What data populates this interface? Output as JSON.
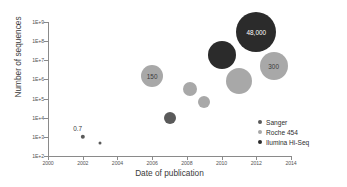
{
  "chart_data": {
    "type": "scatter",
    "title": "",
    "xlabel": "Date of publication",
    "ylabel": "Number of sequences",
    "xlim": [
      2000,
      2014
    ],
    "ylim": [
      100,
      1000000000
    ],
    "yscale": "log",
    "grid": false,
    "legend_position": "bottom-right",
    "xticks": [
      "2000",
      "2002",
      "2004",
      "2006",
      "2008",
      "2010",
      "2012",
      "2014"
    ],
    "yticks": [
      "1E+9",
      "1E+8",
      "1E+7",
      "1E+6",
      "1E+5",
      "1E+4",
      "1E+3",
      "1E+2"
    ],
    "series": [
      {
        "name": "Sanger",
        "color": "#5a5a5a",
        "points": [
          {
            "x": 2002,
            "y": 1000,
            "size": 4.4,
            "label": "",
            "ext_label": "0.7"
          },
          {
            "x": 2003,
            "y": 500,
            "size": 3.0,
            "label": ""
          },
          {
            "x": 2007,
            "y": 10000,
            "size": 12.0,
            "label": ""
          }
        ]
      },
      {
        "name": "Roche 454",
        "color": "#a8a8a8",
        "points": [
          {
            "x": 2006,
            "y": 1500000,
            "size": 22.0,
            "label": "150"
          },
          {
            "x": 2008.2,
            "y": 300000,
            "size": 14.0,
            "label": ""
          },
          {
            "x": 2009,
            "y": 70000,
            "size": 12.0,
            "label": ""
          },
          {
            "x": 2011,
            "y": 800000,
            "size": 26.0,
            "label": ""
          },
          {
            "x": 2013,
            "y": 5000000,
            "size": 28.0,
            "label": "300"
          }
        ]
      },
      {
        "name": "Ilumina Hi-Seq",
        "color": "#2b2b2b",
        "points": [
          {
            "x": 2010,
            "y": 20000000,
            "size": 28.0,
            "label": ""
          },
          {
            "x": 2012,
            "y": 300000000,
            "size": 40.0,
            "label": "48,000"
          }
        ]
      }
    ],
    "annotations": [
      {
        "text": "0.7",
        "x": 2001.6,
        "y": 2200
      },
      {
        "text": "150",
        "x": 2006,
        "y": 1500000
      },
      {
        "text": "48,000",
        "x": 2012,
        "y": 300000000
      },
      {
        "text": "300",
        "x": 2013,
        "y": 5000000
      }
    ]
  },
  "legend": {
    "items": [
      {
        "label": "Sanger",
        "color": "#5a5a5a"
      },
      {
        "label": "Roche 454",
        "color": "#a8a8a8"
      },
      {
        "label": "Ilumina Hi-Seq",
        "color": "#2b2b2b"
      }
    ]
  }
}
